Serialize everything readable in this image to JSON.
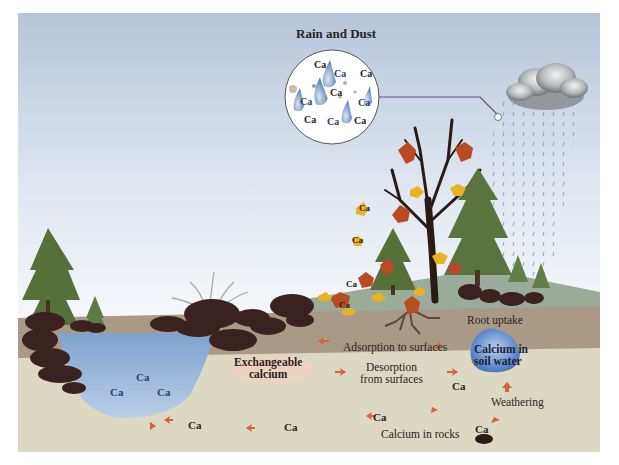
{
  "title": "Rain and Dust",
  "element_symbol": "Ca",
  "inset": {
    "label": "Rain and Dust",
    "particles": [
      "Ca",
      "Ca",
      "Ca",
      "Ca",
      "Ca",
      "Ca",
      "Ca",
      "Ca",
      "Ca"
    ]
  },
  "labels": {
    "root_uptake": "Root uptake",
    "adsorption": "Adsorption to surfaces",
    "exchangeable_line1": "Exchangeable",
    "exchangeable_line2": "calcium",
    "desorption_line1": "Desorption",
    "desorption_line2": "from surfaces",
    "soil_water_line1": "Calcium in",
    "soil_water_line2": "soil water",
    "weathering": "Weathering",
    "rocks": "Calcium in rocks"
  },
  "lake_ca": [
    "Ca",
    "Ca",
    "Ca"
  ],
  "soil_ca": [
    "Ca",
    "Ca",
    "Ca",
    "Ca",
    "Ca"
  ],
  "leaf_ca": [
    "Ca",
    "Ca",
    "Ca",
    "Ca"
  ],
  "colors": {
    "sky_top": "#b9c6da",
    "sky_bottom": "#f4f7fb",
    "topsoil": "#a99a86",
    "subsoil": "#dcd8c2",
    "water": "#8fb0d6",
    "soil_water": "#4f7fc4",
    "rock": "#3a2220",
    "arrow": "#d0643a",
    "conifer": "#56703a",
    "leaf_red": "#b94a22",
    "leaf_yellow": "#e8b320",
    "connector": "#6a4d8a"
  }
}
